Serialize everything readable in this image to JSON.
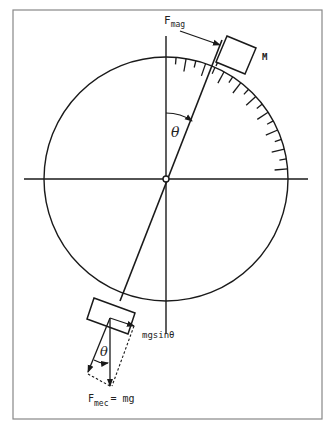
{
  "figure": {
    "type": "pendulum-force-diagram",
    "labels": {
      "f_mag_main": "F",
      "f_mag_sub": "mag",
      "mass": "M",
      "theta_top": "θ",
      "theta_bottom": "θ",
      "mg_sin": "mgsinθ",
      "f_mec_main": "F",
      "f_mec_sub": "mec",
      "f_mec_eq": "= mg"
    },
    "colors": {
      "stroke": "#1a1a1a",
      "frame": "#888888",
      "background": "#ffffff"
    },
    "geometry": {
      "center": [
        166,
        179
      ],
      "radius": 122,
      "rod_angle_deg": 22,
      "tick_count": 18
    }
  }
}
